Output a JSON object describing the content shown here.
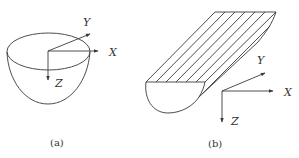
{
  "figure": {
    "panels": [
      {
        "id": "a",
        "caption": "(a)",
        "shape": "half-ellipsoid bowl",
        "axes": {
          "x_label": "X",
          "y_label": "Y",
          "z_label": "Z"
        }
      },
      {
        "id": "b",
        "caption": "(b)",
        "shape": "elongated trough with hatched top face",
        "axes": {
          "x_label": "X",
          "y_label": "Y",
          "z_label": "Z"
        }
      }
    ],
    "colors": {
      "line": "#3a3a3a",
      "background": "#ffffff"
    }
  }
}
